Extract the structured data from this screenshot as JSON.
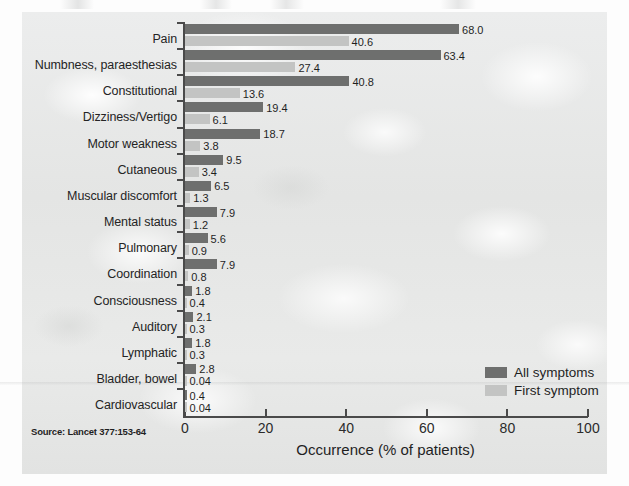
{
  "figure": {
    "source_note": "Source: Lancet 377:153-64",
    "x_axis_title": "Occurrence (% of patients)"
  },
  "legend": {
    "position": "bottom-right",
    "items": [
      {
        "label": "All symptoms",
        "color": "#6e6f6e",
        "swatch": "legend-swatch-all"
      },
      {
        "label": "First symptom",
        "color": "#c3c4c3",
        "swatch": "legend-swatch-first"
      }
    ]
  },
  "chart_data": {
    "type": "bar",
    "orientation": "horizontal",
    "title": "",
    "subtitle": "",
    "xlabel": "Occurrence (% of patients)",
    "ylabel": "",
    "xlim": [
      0,
      100
    ],
    "xticks": [
      0,
      20,
      40,
      60,
      80,
      100
    ],
    "xtick_labels": [
      "0",
      "20",
      "40",
      "60",
      "80",
      "100"
    ],
    "grid": false,
    "legend_position": "bottom-right",
    "categories": [
      "Pain",
      "Numbness, paraesthesias",
      "Constitutional",
      "Dizziness/Vertigo",
      "Motor weakness",
      "Cutaneous",
      "Muscular discomfort",
      "Mental status",
      "Pulmonary",
      "Coordination",
      "Consciousness",
      "Auditory",
      "Lymphatic",
      "Bladder, bowel",
      "Cardiovascular"
    ],
    "series": [
      {
        "name": "All symptoms",
        "color": "#6e6f6e",
        "values": [
          68.0,
          63.4,
          40.8,
          19.4,
          18.7,
          9.5,
          6.5,
          7.9,
          5.6,
          7.9,
          1.8,
          2.1,
          1.8,
          2.8,
          0.4
        ],
        "value_labels": [
          "68.0",
          "63.4",
          "40.8",
          "19.4",
          "18.7",
          "9.5",
          "6.5",
          "7.9",
          "5.6",
          "7.9",
          "1.8",
          "2.1",
          "1.8",
          "2.8",
          "0.4"
        ]
      },
      {
        "name": "First symptom",
        "color": "#c3c4c3",
        "values": [
          40.6,
          27.4,
          13.6,
          6.1,
          3.8,
          3.4,
          1.3,
          1.2,
          0.9,
          0.8,
          0.4,
          0.3,
          0.3,
          0.04,
          0.04
        ],
        "value_labels": [
          "40.6",
          "27.4",
          "13.6",
          "6.1",
          "3.8",
          "3.4",
          "1.3",
          "1.2",
          "0.9",
          "0.8",
          "0.4",
          "0.3",
          "0.3",
          "0.04",
          "0.04"
        ]
      }
    ]
  }
}
